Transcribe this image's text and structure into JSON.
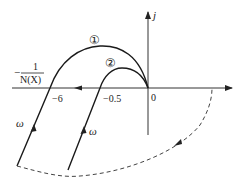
{
  "diagram": {
    "type": "nyquist-describing-function-plot",
    "axes": {
      "imag_label": "j",
      "origin_label": "0"
    },
    "points": [
      {
        "label": "−6",
        "x_value": -6
      },
      {
        "label": "−0.5",
        "x_value": -0.5
      }
    ],
    "describing_function_label": {
      "prefix": "−",
      "numerator": "1",
      "denominator": "N(X)"
    },
    "curves": [
      {
        "id": "curve-1",
        "label": "①",
        "param_label": "ω"
      },
      {
        "id": "curve-2",
        "label": "②",
        "param_label": "ω"
      }
    ],
    "colors": {
      "line": "#1a1a1a",
      "dashed": "#444444",
      "axis": "#333333"
    }
  }
}
